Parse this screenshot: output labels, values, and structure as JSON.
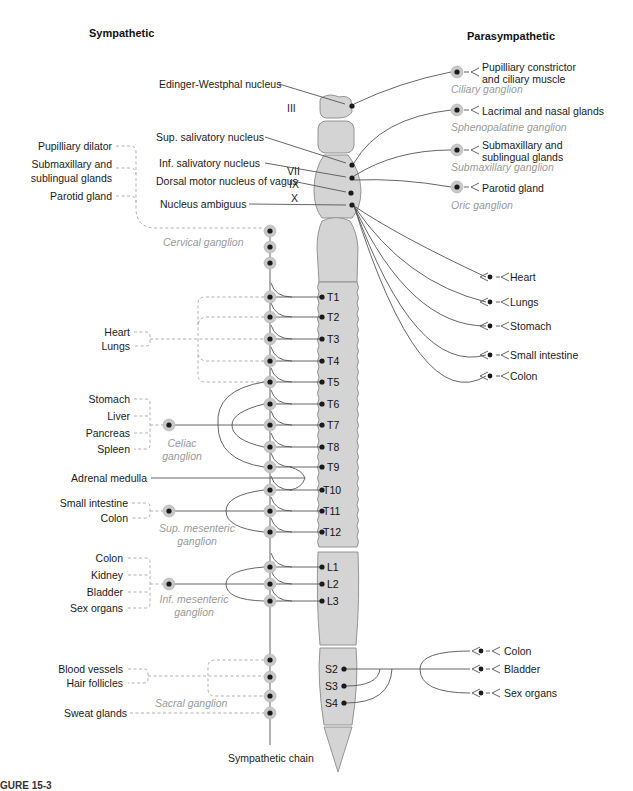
{
  "headers": {
    "sympathetic": "Sympathetic",
    "parasympathetic": "Parasympathetic"
  },
  "colors": {
    "cord_fill": "#d4d4d4",
    "cord_stroke": "#8a8a8a",
    "line": "#555555",
    "dashed": "#a8a8a8",
    "ganglion_ring": "#c8c8c8",
    "ganglion_label": "#9a9a9a",
    "dot": "#1a1a1a"
  },
  "brainstem_nuclei": [
    {
      "label": "Edinger-Westphal nucleus",
      "x": 159,
      "y": 84
    },
    {
      "label": "Sup. salivatory nucleus",
      "x": 156,
      "y": 137
    },
    {
      "label": "Inf. salivatory nucleus",
      "x": 159,
      "y": 163
    },
    {
      "label": "Dorsal motor nucleus of vagus",
      "x": 156,
      "y": 181
    },
    {
      "label": "Nucleus ambiguus",
      "x": 160,
      "y": 204
    }
  ],
  "cranial_roman": [
    {
      "label": "III",
      "x": 292,
      "y": 107
    },
    {
      "label": "VII",
      "x": 296,
      "y": 169
    },
    {
      "label": "IX",
      "x": 300,
      "y": 179
    },
    {
      "label": "X",
      "x": 300,
      "y": 193
    }
  ],
  "para_cranial_targets": [
    {
      "label": "Pupilliary constrictor",
      "label2": "and ciliary muscle",
      "ganglion": "Ciliary ganglion",
      "y": 72
    },
    {
      "label": "Lacrimal and nasal glands",
      "label2": "",
      "ganglion": "Sphenopalatine ganglion",
      "y": 110
    },
    {
      "label": "Submaxillary and",
      "label2": "sublingual glands",
      "ganglion": "Submaxillary ganglion",
      "y": 150
    },
    {
      "label": "Parotid gland",
      "label2": "",
      "ganglion": "Oric ganglion",
      "y": 187
    }
  ],
  "vagus_targets": [
    {
      "label": "Heart",
      "y": 277
    },
    {
      "label": "Lungs",
      "y": 302
    },
    {
      "label": "Stomach",
      "y": 326
    },
    {
      "label": "Small intestine",
      "y": 355
    },
    {
      "label": "Colon",
      "y": 376
    }
  ],
  "sacral_para_targets": [
    {
      "label": "Colon",
      "y": 651
    },
    {
      "label": "Bladder",
      "y": 669
    },
    {
      "label": "Sex organs",
      "y": 693
    }
  ],
  "segments": [
    {
      "label": "T1",
      "y": 297
    },
    {
      "label": "T2",
      "y": 317
    },
    {
      "label": "T3",
      "y": 339
    },
    {
      "label": "T4",
      "y": 361
    },
    {
      "label": "T5",
      "y": 382
    },
    {
      "label": "T6",
      "y": 404
    },
    {
      "label": "T7",
      "y": 425
    },
    {
      "label": "T8",
      "y": 447
    },
    {
      "label": "T9",
      "y": 467
    },
    {
      "label": "T10",
      "y": 490
    },
    {
      "label": "T11",
      "y": 511
    },
    {
      "label": "T12",
      "y": 532
    },
    {
      "label": "L1",
      "y": 567
    },
    {
      "label": "L2",
      "y": 584
    },
    {
      "label": "L3",
      "y": 601
    },
    {
      "label": "S2",
      "y": 669
    },
    {
      "label": "S3",
      "y": 686
    },
    {
      "label": "S4",
      "y": 703
    }
  ],
  "sympathetic_targets": {
    "head": [
      {
        "label": "Pupilliary dilator",
        "y": 146
      },
      {
        "label": "Submaxillary and",
        "label2": "sublingual glands",
        "y": 163
      },
      {
        "label": "Parotid gland",
        "y": 196
      }
    ],
    "thoracic": [
      {
        "label": "Heart",
        "y": 332
      },
      {
        "label": "Lungs",
        "y": 346
      }
    ],
    "celiac": [
      {
        "label": "Stomach",
        "y": 399
      },
      {
        "label": "Liver",
        "y": 416
      },
      {
        "label": "Pancreas",
        "y": 433
      },
      {
        "label": "Spleen",
        "y": 449
      }
    ],
    "adrenal": [
      {
        "label": "Adrenal medulla",
        "y": 478
      }
    ],
    "sup_mes": [
      {
        "label": "Small intestine",
        "y": 503
      },
      {
        "label": "Colon",
        "y": 518
      }
    ],
    "inf_mes": [
      {
        "label": "Colon",
        "y": 558
      },
      {
        "label": "Kidney",
        "y": 575
      },
      {
        "label": "Bladder",
        "y": 592
      },
      {
        "label": "Sex organs",
        "y": 608
      }
    ],
    "sacral": [
      {
        "label": "Blood vessels",
        "y": 669
      },
      {
        "label": "Hair follicles",
        "y": 683
      },
      {
        "label": "Sweat glands",
        "y": 713
      }
    ]
  },
  "ganglia_labels": {
    "cervical": "Cervical ganglion",
    "celiac": "Celiac",
    "celiac2": "ganglion",
    "sup_mes": "Sup. mesenteric",
    "sup_mes2": "ganglion",
    "inf_mes": "Inf. mesenteric",
    "inf_mes2": "ganglion",
    "sacral": "Sacral ganglion"
  },
  "chain_label": "Sympathetic chain",
  "figure_label": "GURE 15-3"
}
